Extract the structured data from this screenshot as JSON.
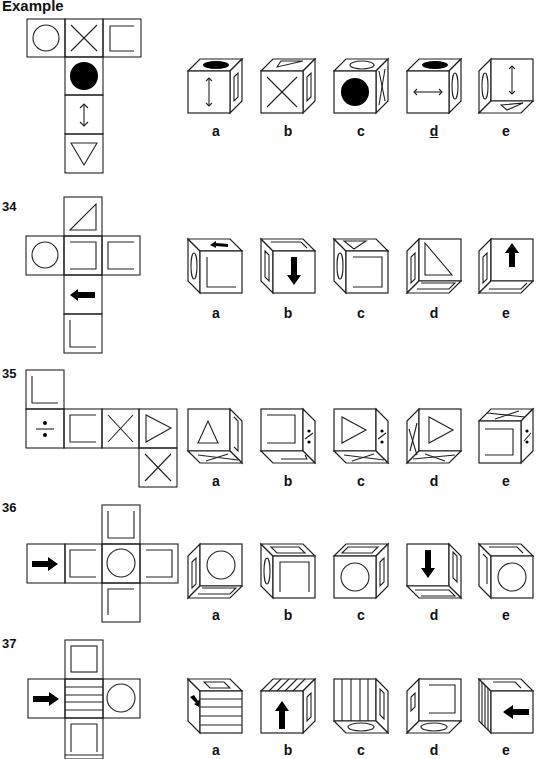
{
  "page": {
    "example_label": "Example",
    "questions": [
      {
        "number": "Example",
        "net_faces": [
          "circle",
          "x-cross",
          "square-bracket",
          "filled-circle",
          "vertical-double-arrow",
          "down-triangle"
        ],
        "options": [
          {
            "label": "a",
            "top": "filled-ellipse",
            "front": "vertical-double-arrow",
            "side": "bracket"
          },
          {
            "label": "b",
            "top": "triangle",
            "front": "x-cross",
            "side": "bracket"
          },
          {
            "label": "c",
            "top": "ellipse",
            "front": "filled-circle",
            "side": "x-cross"
          },
          {
            "label": "d",
            "top": "filled-ellipse",
            "front": "horizontal-double-arrow",
            "side": "ellipse",
            "underlined": true
          },
          {
            "label": "e",
            "left": "ellipse",
            "front": "vertical-double-arrow",
            "bottom": "triangle"
          }
        ]
      },
      {
        "number": "34",
        "net_faces": [
          "right-triangle",
          "circle",
          "bracket-right",
          "bracket-left",
          "left-arrow",
          "L-corner"
        ],
        "options": [
          {
            "label": "a"
          },
          {
            "label": "b"
          },
          {
            "label": "c"
          },
          {
            "label": "d"
          },
          {
            "label": "e"
          }
        ]
      },
      {
        "number": "35",
        "net_faces": [
          "L-corner",
          "divide-sign",
          "bracket",
          "x-cross",
          "right-triangle",
          "x-cross"
        ],
        "options": [
          {
            "label": "a"
          },
          {
            "label": "b"
          },
          {
            "label": "c"
          },
          {
            "label": "d"
          },
          {
            "label": "e"
          }
        ]
      },
      {
        "number": "36",
        "net_faces": [
          "right-arrow",
          "bracket",
          "circle",
          "bracket",
          "U-bracket",
          "corner"
        ],
        "options": [
          {
            "label": "a"
          },
          {
            "label": "b"
          },
          {
            "label": "c"
          },
          {
            "label": "d"
          },
          {
            "label": "e"
          }
        ]
      },
      {
        "number": "37",
        "net_faces": [
          "square",
          "right-arrow",
          "horizontal-stripes",
          "circle",
          "square"
        ],
        "options": [
          {
            "label": "a"
          },
          {
            "label": "b"
          },
          {
            "label": "c"
          },
          {
            "label": "d"
          },
          {
            "label": "e"
          }
        ]
      }
    ]
  }
}
